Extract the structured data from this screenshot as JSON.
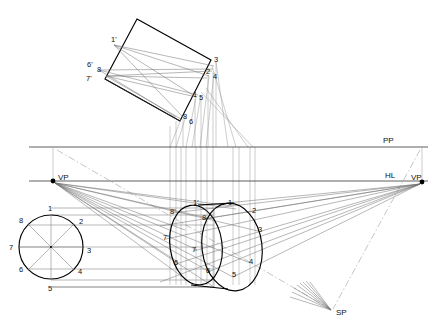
{
  "drawing": {
    "title": "Two-point perspective construction of a cylinder",
    "canvas": {
      "width": 440,
      "height": 326,
      "background": "#ffffff"
    },
    "colors": {
      "heavy": "#000000",
      "medium": "#2a2a2a",
      "light": "#6e6e6e",
      "very_light": "#8f8f8f",
      "dash_dot": "#8a8a8a",
      "label_text": "#111111"
    }
  },
  "reference_lines": {
    "picture_plane": {
      "label": "PP",
      "y": 147,
      "x1": 29,
      "x2": 428,
      "label_x": 383,
      "label_y": 143
    },
    "horizon_line": {
      "label": "HL",
      "y": 181,
      "x1": 29,
      "x2": 428,
      "label_x": 385,
      "label_y": 177
    }
  },
  "points": {
    "vp_left": {
      "label": "VP",
      "x": 53,
      "y": 181,
      "label_x": 58,
      "label_y": 180
    },
    "vp_right": {
      "label": "VP",
      "x": 422,
      "y": 182,
      "label_x": 414,
      "label_y": 180
    },
    "station_point": {
      "label": "SP",
      "x": 330,
      "y": 312,
      "label_x": 336,
      "label_y": 315
    }
  },
  "plan_circle": {
    "name": "orthographic-plan-circle",
    "center_x": 51,
    "center_y": 247,
    "radius": 32,
    "labels": [
      {
        "text": "1",
        "x": 48,
        "y": 211
      },
      {
        "text": "2",
        "x": 79,
        "y": 223
      },
      {
        "text": "3",
        "x": 87,
        "y": 252
      },
      {
        "text": "4",
        "x": 78,
        "y": 272
      },
      {
        "text": "5",
        "x": 48,
        "y": 290
      },
      {
        "text": "6",
        "x": 20,
        "y": 271
      },
      {
        "text": "7",
        "x": 10,
        "y": 250
      },
      {
        "text": "8",
        "x": 20,
        "y": 222
      }
    ]
  },
  "rotated_plan": {
    "name": "rotated-plan-rectangle",
    "corners": [
      {
        "x": 137,
        "y": 19
      },
      {
        "x": 211,
        "y": 60
      },
      {
        "x": 180,
        "y": 121
      },
      {
        "x": 105,
        "y": 79
      }
    ],
    "labels": [
      {
        "text": "1'",
        "x": 113,
        "y": 41
      },
      {
        "text": "3",
        "x": 214,
        "y": 61
      },
      {
        "text": "2",
        "x": 207,
        "y": 73
      },
      {
        "text": "4",
        "x": 213,
        "y": 78
      },
      {
        "text": "6'",
        "x": 89,
        "y": 66
      },
      {
        "text": "8",
        "x": 98,
        "y": 71
      },
      {
        "text": "7'",
        "x": 87,
        "y": 80
      },
      {
        "text": "1",
        "x": 194,
        "y": 96
      },
      {
        "text": "5",
        "x": 200,
        "y": 99
      },
      {
        "text": "8",
        "x": 184,
        "y": 119
      },
      {
        "text": "6",
        "x": 190,
        "y": 123
      }
    ]
  },
  "perspective_cylinder": {
    "name": "perspective-cylinder",
    "back_ellipse": {
      "cx": 196,
      "cy": 245,
      "rx": 26,
      "ry": 40,
      "rotation": -8
    },
    "front_ellipse": {
      "cx": 232,
      "cy": 247,
      "rx": 30,
      "ry": 44,
      "rotation": -7
    },
    "back_labels": [
      {
        "text": "1'",
        "x": 195,
        "y": 206
      },
      {
        "text": "8'",
        "x": 172,
        "y": 213
      },
      {
        "text": "7'",
        "x": 165,
        "y": 239
      },
      {
        "text": "6",
        "x": 175,
        "y": 264
      }
    ],
    "front_labels": [
      {
        "text": "1",
        "x": 228,
        "y": 206
      },
      {
        "text": "8",
        "x": 203,
        "y": 219
      },
      {
        "text": "2",
        "x": 252,
        "y": 212
      },
      {
        "text": "3",
        "x": 258,
        "y": 231
      },
      {
        "text": "4",
        "x": 250,
        "y": 263
      },
      {
        "text": "7",
        "x": 193,
        "y": 251
      },
      {
        "text": "5",
        "x": 233,
        "y": 276
      },
      {
        "text": "6",
        "x": 207,
        "y": 272
      }
    ]
  },
  "legend": {
    "pp_full": "PP",
    "hl_full": "HL",
    "vp_full": "VP",
    "sp_full": "SP"
  }
}
